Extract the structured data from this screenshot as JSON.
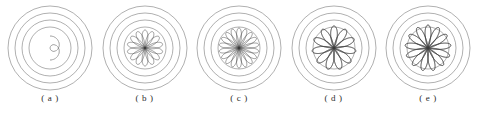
{
  "figure": {
    "type": "diagram",
    "background_color": "#ffffff",
    "ring_color": "#6e6e6e",
    "curve_color": "#3a3a3a",
    "ring_count": 4,
    "ring_radii": [
      42,
      35,
      28,
      21
    ],
    "center": {
      "x": 46,
      "y": 48
    },
    "panels": [
      {
        "id": "panel-a",
        "caption": "( a )",
        "letter": "a",
        "rose": {
          "petals": 1,
          "k_numerator": 1,
          "k_denominator": 2,
          "amplitude": 12,
          "theta_max_turns": 1,
          "phase_deg": -90,
          "loop_count": 1
        }
      },
      {
        "id": "panel-b",
        "caption": "( b )",
        "letter": "b",
        "rose": {
          "petals": 7,
          "k_numerator": 7,
          "k_denominator": 2,
          "amplitude": 18,
          "theta_max_turns": 2,
          "phase_deg": -90,
          "loop_count": 7
        }
      },
      {
        "id": "panel-c",
        "caption": "( c )",
        "letter": "c",
        "rose": {
          "petals": 9,
          "k_numerator": 9,
          "k_denominator": 2,
          "amplitude": 20,
          "theta_max_turns": 2,
          "phase_deg": -90,
          "loop_count": 9
        }
      },
      {
        "id": "panel-d",
        "caption": "( d )",
        "letter": "d",
        "rose": {
          "petals": 11,
          "k_numerator": 11,
          "k_denominator": 3,
          "amplitude": 22,
          "theta_max_turns": 3,
          "phase_deg": -90,
          "loop_count": 11
        }
      },
      {
        "id": "panel-e",
        "caption": "( e )",
        "letter": "e",
        "rose": {
          "petals": 13,
          "k_numerator": 13,
          "k_denominator": 3,
          "amplitude": 23,
          "theta_max_turns": 3,
          "phase_deg": -90,
          "loop_count": 13
        }
      }
    ]
  },
  "chart_data": {
    "type": "line",
    "title": "",
    "xlabel": "",
    "ylabel": "",
    "series": [
      {
        "name": "a",
        "petals": 1,
        "amplitude": 12,
        "rings": [
          42,
          35,
          28,
          21
        ]
      },
      {
        "name": "b",
        "petals": 7,
        "amplitude": 18,
        "rings": [
          42,
          35,
          28,
          21
        ]
      },
      {
        "name": "c",
        "petals": 9,
        "amplitude": 20,
        "rings": [
          42,
          35,
          28,
          21
        ]
      },
      {
        "name": "d",
        "petals": 11,
        "amplitude": 22,
        "rings": [
          42,
          35,
          28,
          21
        ]
      },
      {
        "name": "e",
        "petals": 13,
        "amplitude": 23,
        "rings": [
          42,
          35,
          28,
          21
        ]
      }
    ],
    "categories": [
      "( a )",
      "( b )",
      "( c )",
      "( d )",
      "( e )"
    ],
    "values": [
      1,
      7,
      9,
      11,
      13
    ],
    "grid": false,
    "legend": "none"
  }
}
